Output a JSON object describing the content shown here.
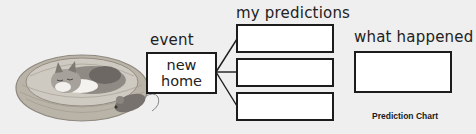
{
  "diagram": {
    "caption": "Prediction Chart",
    "event": {
      "heading": "event",
      "value": "new home"
    },
    "predictions": {
      "heading": "my predictions",
      "items": [
        "",
        "",
        ""
      ]
    },
    "outcome": {
      "heading": "what happened",
      "value": ""
    },
    "illustration": "kitten sleeping in a wicker basket with a toy mouse"
  }
}
